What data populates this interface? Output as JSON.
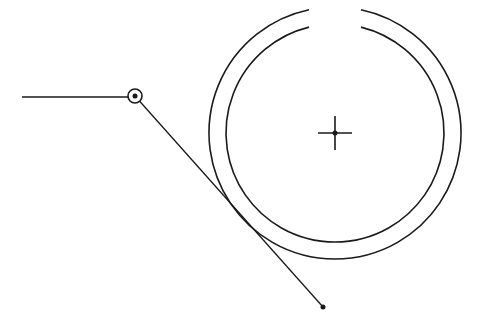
{
  "drawing": {
    "background": "#ffffff",
    "stroke_color": "#1a1a1a",
    "horizontal_line": {
      "x1": 22,
      "y1": 97,
      "x2": 129,
      "y2": 97
    },
    "pivot_point": {
      "cx": 135,
      "cy": 96,
      "ring_r": 7,
      "dot_r": 2.5
    },
    "diagonal_line": {
      "x1": 135,
      "y1": 96,
      "x2": 323,
      "y2": 307
    },
    "end_point": {
      "cx": 323,
      "cy": 307,
      "r": 2.5
    },
    "ring": {
      "center": {
        "cx": 335,
        "cy": 133
      },
      "outer_r": 126,
      "inner_r": 109,
      "gap_left_x": 309,
      "gap_right_x": 361
    },
    "center_cross": {
      "cx": 335,
      "cy": 133,
      "arm": 17,
      "dot_r": 2.5
    }
  }
}
